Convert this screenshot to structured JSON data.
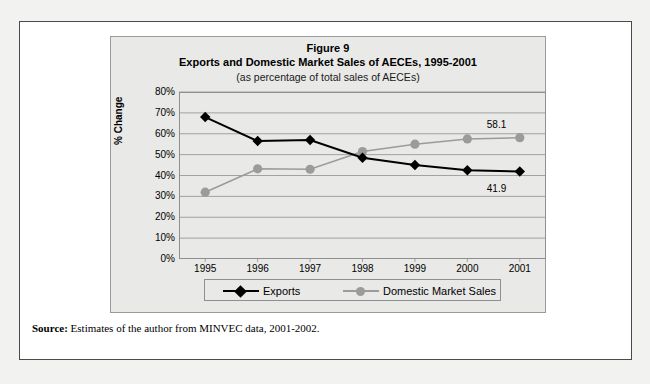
{
  "figure": {
    "title": "Figure 9",
    "subtitle": "Exports and Domestic Market Sales of AECEs, 1995-2001",
    "note": "(as percentage of total sales of AECEs)",
    "source_prefix": "Source:",
    "source_text": " Estimates of the author from MINVEC data, 2001-2002."
  },
  "legend": {
    "exports_label": "Exports",
    "domestic_label": "Domestic Market Sales"
  },
  "colors": {
    "exports": "#000000",
    "domestic": "#9b9b9b",
    "panel_background": "#e9e9e7",
    "page_background": "#f2f2f0",
    "gridline": "#8f8f8f",
    "border": "#4a4a4a"
  },
  "chart_data": {
    "type": "line",
    "subtitle": "(as percentage of total sales of AECEs)",
    "xlabel": "",
    "ylabel": "% Change",
    "categories": [
      "1995",
      "1996",
      "1997",
      "1998",
      "1999",
      "2000",
      "2001"
    ],
    "x_tick_labels": [
      "1995",
      "1996",
      "1997",
      "1998",
      "1999",
      "2000",
      "2001"
    ],
    "y_tick_labels": [
      "0%",
      "10%",
      "20%",
      "30%",
      "40%",
      "50%",
      "60%",
      "70%",
      "80%"
    ],
    "y_ticks": [
      0,
      10,
      20,
      30,
      40,
      50,
      60,
      70,
      80
    ],
    "ylim": [
      0,
      80
    ],
    "grid": true,
    "legend_position": "bottom",
    "series": [
      {
        "name": "Exports",
        "marker": "diamond",
        "color": "#000000",
        "values": [
          68.0,
          56.5,
          57.0,
          48.5,
          45.0,
          42.5,
          41.9
        ]
      },
      {
        "name": "Domestic Market Sales",
        "marker": "circle",
        "color": "#9b9b9b",
        "values": [
          32.0,
          43.2,
          43.0,
          51.5,
          55.0,
          57.5,
          58.1
        ]
      }
    ],
    "annotations": [
      {
        "text": "58.1",
        "series": "Domestic Market Sales",
        "x": "2001",
        "y": 58.1
      },
      {
        "text": "41.9",
        "series": "Exports",
        "x": "2001",
        "y": 41.9
      }
    ]
  }
}
